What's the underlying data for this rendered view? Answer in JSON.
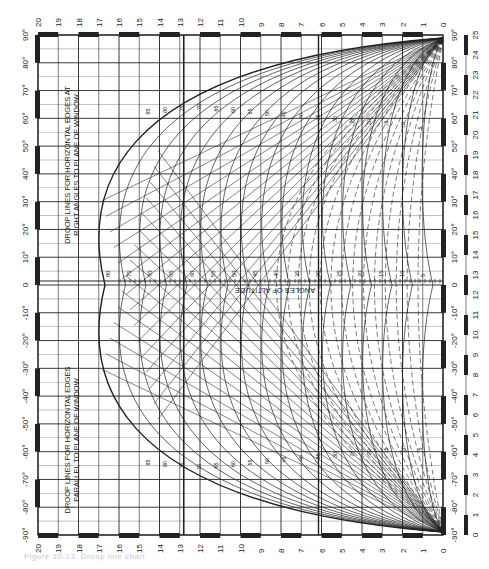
{
  "figure": {
    "orientation": "rotated-90-ccw",
    "caption": "Figure 10-13. Droop line chart",
    "top_scale": [
      "20",
      "19",
      "18",
      "17",
      "16",
      "15",
      "14",
      "13",
      "12",
      "11",
      "10",
      "9",
      "8",
      "7",
      "6",
      "5",
      "4",
      "3",
      "2",
      "1",
      "0"
    ],
    "bottom_scale": [
      "20",
      "19",
      "18",
      "17",
      "16",
      "15",
      "14",
      "13",
      "12",
      "11",
      "10",
      "9",
      "8",
      "7",
      "6",
      "5",
      "4",
      "3",
      "2",
      "1",
      "0"
    ],
    "left_angle_scale": [
      "90°",
      "80°",
      "70°",
      "60°",
      "50°",
      "40°",
      "30°",
      "20°",
      "10°",
      "0",
      "-10°",
      "-20°",
      "-30°",
      "-40°",
      "-50°",
      "-60°",
      "-70°",
      "-80°",
      "-90°"
    ],
    "right_angle_scale": [
      "90°",
      "80°",
      "70°",
      "60°",
      "50°",
      "40°",
      "30°",
      "20°",
      "10°",
      "0",
      "-10°",
      "-20°",
      "-30°",
      "-40°",
      "-50°",
      "-60°",
      "-70°",
      "-80°",
      "-90°"
    ],
    "far_right_scale": [
      "25",
      "24",
      "23",
      "22",
      "21",
      "20",
      "19",
      "18",
      "17",
      "16",
      "15",
      "14",
      "13",
      "12",
      "11",
      "10",
      "9",
      "8",
      "7",
      "6",
      "5",
      "4",
      "3",
      "2",
      "1",
      "0"
    ],
    "label_right_angles": "DROOP LINES FOR HORIZONTAL EDGES AT RIGHT ANGLES TO PLANE OF WINDOW",
    "label_parallel": "DROOP LINES FOR HORIZONTAL EDGES PARALLEL TO PLANE OF WINDOW",
    "axis_label": "ANGLES OF ALTITUDE",
    "altitude_ticks": [
      "80",
      "75",
      "70",
      "65",
      "60",
      "55",
      "50",
      "45",
      "40",
      "35",
      "30",
      "25",
      "20",
      "15",
      "10",
      "5"
    ],
    "curve_labels": [
      "85",
      "80",
      "75",
      "70",
      "65",
      "60",
      "55",
      "50",
      "45",
      "40",
      "35",
      "30",
      "25",
      "20",
      "15",
      "10",
      "5"
    ],
    "colors": {
      "ink": "#222222",
      "grid": "#333333",
      "paper": "#ffffff",
      "caption": "#c8c8c8"
    }
  }
}
